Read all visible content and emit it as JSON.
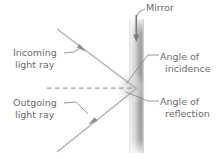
{
  "diagram": {
    "background_color": "#ffffff",
    "text_color": "#6b6b6b",
    "ray_color": "#a8a8a8",
    "leader_color": "#8a8a8a",
    "mirror_light": "#ededed",
    "mirror_dark": "#8e8e8e"
  },
  "labels": {
    "mirror": {
      "line1": "Mirror"
    },
    "incoming_ray": {
      "line1": "Incoming",
      "line2": "light ray"
    },
    "outgoing_ray": {
      "line1": "Outgoing",
      "line2": "light ray"
    },
    "angle_of_incidence": {
      "line1": "Angle of",
      "line2": "incidence"
    },
    "angle_of_reflection": {
      "line1": "Angle of",
      "line2": "reflection"
    }
  },
  "elements": {
    "mirror_bar": "vertical-gradient-bar",
    "normal_line": "dashed-horizontal-normal",
    "incident_ray": "arrow-down-right",
    "reflected_ray": "arrow-down-left",
    "reflection_point": "glow-spot"
  }
}
